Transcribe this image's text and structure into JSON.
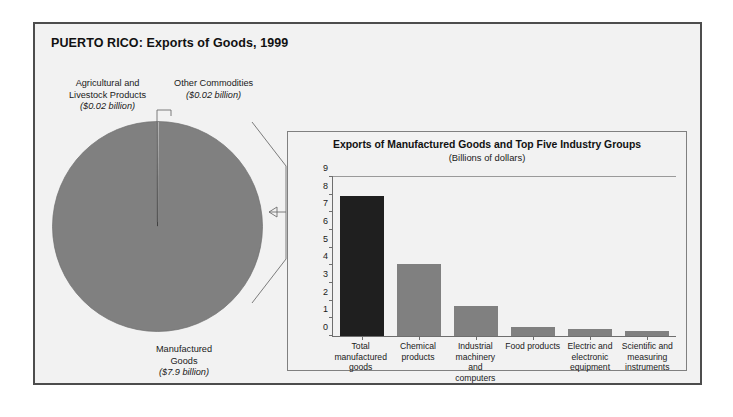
{
  "figure": {
    "title": "PUERTO RICO: Exports of Goods, 1999"
  },
  "pie": {
    "slices": [
      {
        "label": "Manufactured Goods",
        "amount": "($7.9 billion)",
        "value": 7.9,
        "color": "#808080"
      },
      {
        "label": "Agricultural and Livestock Products",
        "amount": "($0.02 billion)",
        "value": 0.02,
        "color": "#d9d9d9"
      },
      {
        "label": "Other Commodities",
        "amount": "($0.02 billion)",
        "value": 0.02,
        "color": "#bfbfbf"
      }
    ],
    "labels": {
      "agricultural_line1": "Agricultural and",
      "agricultural_line2": "Livestock Products",
      "agricultural_amount": "($0.02 billion)",
      "other_line1": "Other Commodities",
      "other_amount": "($0.02 billion)",
      "manufactured_line1": "Manufactured",
      "manufactured_line2": "Goods",
      "manufactured_amount": "($7.9 billion)"
    }
  },
  "bar_panel": {
    "title": "Exports of Manufactured Goods and Top Five Industry Groups",
    "subtitle": "(Billions of dollars)"
  },
  "chart_data": {
    "type": "bar",
    "title": "Exports of Manufactured Goods and Top Five Industry Groups",
    "subtitle": "(Billions of dollars)",
    "xlabel": "",
    "ylabel": "",
    "ylim": [
      0,
      9
    ],
    "yticks": [
      0,
      1,
      2,
      3,
      4,
      5,
      6,
      7,
      8,
      9
    ],
    "ytick_labels": [
      "0",
      "1",
      "2",
      "3",
      "4",
      "5",
      "6",
      "7",
      "8",
      "9"
    ],
    "grid": false,
    "legend": "none",
    "categories": [
      "Total manufactured goods",
      "Chemical products",
      "Industrial machinery and computers",
      "Food products",
      "Electric and electronic equipment",
      "Scientific and measuring instruments"
    ],
    "category_lines": [
      [
        "Total",
        "manufactured",
        "goods"
      ],
      [
        "Chemical",
        "products"
      ],
      [
        "Industrial",
        "machinery and",
        "computers"
      ],
      [
        "Food products"
      ],
      [
        "Electric and",
        "electronic",
        "equipment"
      ],
      [
        "Scientific and",
        "measuring",
        "instruments"
      ]
    ],
    "values": [
      7.9,
      4.1,
      1.7,
      0.5,
      0.4,
      0.3
    ],
    "colors": [
      "#1f1f1f",
      "#808080",
      "#808080",
      "#808080",
      "#808080",
      "#808080"
    ]
  },
  "colors": {
    "panel_background": "#f2f2f2",
    "figure_border": "#4d4d4d",
    "bar_gray": "#808080",
    "bar_dark": "#1f1f1f",
    "axis": "#6e6e6e"
  }
}
